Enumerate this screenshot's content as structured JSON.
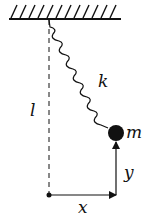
{
  "diagram": {
    "labels": {
      "spring_constant": "k",
      "mass": "m",
      "length": "l",
      "x_axis": "x",
      "y_axis": "y"
    },
    "colors": {
      "ink": "#111111",
      "background": "#ffffff"
    }
  }
}
